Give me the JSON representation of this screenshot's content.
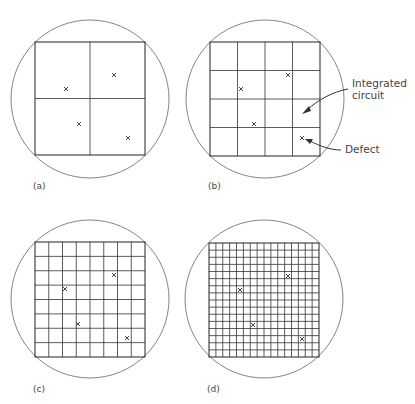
{
  "figure": {
    "panels": [
      {
        "id": "a",
        "label": "(a)",
        "grid": 2,
        "wafer": {
          "cx": 90,
          "cy": 99,
          "r": 79
        },
        "square": {
          "x": 35,
          "y": 42,
          "w": 110,
          "h": 113
        },
        "defects": [
          [
            66,
            89
          ],
          [
            114,
            75
          ],
          [
            79,
            124
          ],
          [
            128,
            138
          ]
        ],
        "label_pos": [
          33,
          189
        ]
      },
      {
        "id": "b",
        "label": "(b)",
        "grid": 4,
        "wafer": {
          "cx": 265,
          "cy": 99,
          "r": 79
        },
        "square": {
          "x": 210,
          "y": 42,
          "w": 110,
          "h": 114
        },
        "defects": [
          [
            241,
            89
          ],
          [
            288,
            75
          ],
          [
            254,
            124
          ],
          [
            302,
            138
          ]
        ],
        "label_pos": [
          208,
          189
        ]
      },
      {
        "id": "c",
        "label": "(c)",
        "grid": 8,
        "wafer": {
          "cx": 90,
          "cy": 299,
          "r": 79
        },
        "square": {
          "x": 35,
          "y": 242,
          "w": 110,
          "h": 115
        },
        "defects": [
          [
            65,
            289
          ],
          [
            114,
            275
          ],
          [
            78,
            324
          ],
          [
            127,
            338
          ]
        ],
        "label_pos": [
          33,
          392
        ]
      },
      {
        "id": "d",
        "label": "(d)",
        "grid": 16,
        "wafer": {
          "cx": 264,
          "cy": 299,
          "r": 79
        },
        "square": {
          "x": 209,
          "y": 243,
          "w": 110,
          "h": 114
        },
        "defects": [
          [
            240,
            290
          ],
          [
            288,
            276
          ],
          [
            253,
            325
          ],
          [
            302,
            339
          ]
        ],
        "label_pos": [
          207,
          392
        ]
      }
    ],
    "annotations": {
      "integrated_circuit": {
        "line1": "Integrated",
        "line2": "circuit"
      },
      "defect": {
        "text": "Defect"
      }
    }
  }
}
